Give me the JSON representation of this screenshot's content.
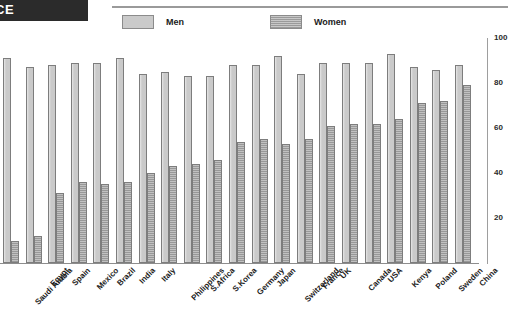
{
  "header": {
    "banner_text": "CE"
  },
  "legend": {
    "position": "top",
    "entries": [
      {
        "label": "Men",
        "color": "#cacaca",
        "icon": "legend-swatch-men"
      },
      {
        "label": "Women",
        "color": "#9b9b9b",
        "icon": "legend-swatch-women"
      }
    ]
  },
  "chart_data": {
    "type": "bar",
    "title": "",
    "subtitle": "",
    "xlabel": "",
    "ylabel": "",
    "ylim": [
      0,
      100
    ],
    "yticks": [
      20,
      40,
      60,
      80,
      100
    ],
    "grid": false,
    "legend_position": "top",
    "categories": [
      "Saudi Arabia",
      "Egypt",
      "Spain",
      "Mexico",
      "Brazil",
      "India",
      "Italy",
      "Philippines",
      "S.Africa",
      "S.Korea",
      "Germany",
      "Japan",
      "Switzerland",
      "France",
      "UK",
      "Canada",
      "USA",
      "Kenya",
      "Poland",
      "Sweden",
      "China"
    ],
    "series": [
      {
        "name": "Men",
        "color": "#cacaca",
        "values": [
          91,
          87,
          88,
          89,
          89,
          91,
          84,
          85,
          83,
          83,
          88,
          88,
          92,
          84,
          89,
          89,
          89,
          93,
          87,
          86,
          88
        ]
      },
      {
        "name": "Women",
        "color": "#9b9b9b",
        "values": [
          10,
          12,
          31,
          36,
          35,
          36,
          40,
          43,
          44,
          46,
          54,
          55,
          53,
          55,
          61,
          62,
          62,
          64,
          71,
          72,
          79
        ]
      }
    ]
  }
}
